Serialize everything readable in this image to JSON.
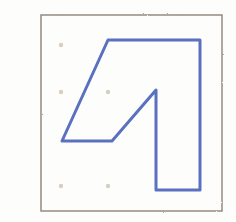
{
  "figure": {
    "panel_label": "E",
    "caption": "",
    "background_color": "#fdfdfb",
    "width": 236,
    "height": 222
  },
  "frame": {
    "name": "hand-drawn square border",
    "color": "#8d837b",
    "stroke_width": 1.4,
    "x": 41,
    "y": 15,
    "width": 181,
    "height": 196
  },
  "shape": {
    "name": "blue polygon outline",
    "color": "#5a6fc0",
    "stroke_width": 3.0,
    "closed": true,
    "vertex_count": 7,
    "vertices": [
      {
        "x": 108,
        "y": 40
      },
      {
        "x": 200,
        "y": 40
      },
      {
        "x": 200,
        "y": 190
      },
      {
        "x": 156,
        "y": 190
      },
      {
        "x": 156,
        "y": 90
      },
      {
        "x": 112,
        "y": 141
      },
      {
        "x": 62,
        "y": 141
      }
    ]
  },
  "dots": {
    "name": "faint registration dots",
    "color": "#b9a78f",
    "radius": 2.2,
    "points": [
      {
        "x": 61,
        "y": 45
      },
      {
        "x": 61,
        "y": 92
      },
      {
        "x": 108,
        "y": 92
      },
      {
        "x": 61,
        "y": 186
      },
      {
        "x": 108,
        "y": 186
      }
    ]
  }
}
